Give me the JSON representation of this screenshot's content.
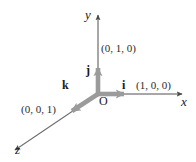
{
  "figure": {
    "background_color": "#ffffff",
    "axis_color": "#8a8a8a",
    "axis_arrow_color": "#4a4a4a",
    "vector_color": "#9b9b9b",
    "text_color": "#1a1a1a"
  },
  "axes": [
    {
      "name": "x-axis",
      "label": "x"
    },
    {
      "name": "y-axis",
      "label": "y"
    },
    {
      "name": "z-axis",
      "label": "z"
    }
  ],
  "origin": {
    "label": "O"
  },
  "vectors": [
    {
      "name": "i-vector",
      "label": "i",
      "coordinate": "(1, 0, 0)"
    },
    {
      "name": "j-vector",
      "label": "j",
      "coordinate": "(0, 1, 0)"
    },
    {
      "name": "k-vector",
      "label": "k",
      "coordinate": "(0, 0, 1)"
    }
  ]
}
